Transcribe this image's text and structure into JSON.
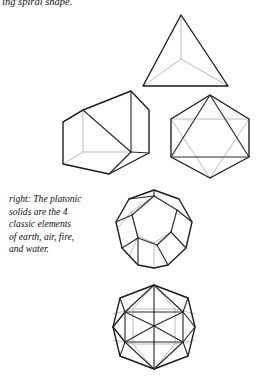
{
  "page": {
    "background_color": "#ffffff",
    "width": 258,
    "height": 376
  },
  "colors": {
    "text": "#111111",
    "visible_edge": "#1b1b1b",
    "inner_edge": "#2a2a2a",
    "hidden_edge": "#bdbdbd"
  },
  "top_caption": {
    "text": "ing spiral shape."
  },
  "side_caption": {
    "lines": [
      "right: The platonic",
      "solids are the 4",
      "classic elements",
      "of earth, air, fire,",
      "and water."
    ],
    "full_text": "right: The platonic solids are the 4 classic elements of earth, air, fire, and water."
  },
  "figures": [
    {
      "name": "tetrahedron",
      "label": "tetrahedron",
      "faces": 4,
      "element": "fire"
    },
    {
      "name": "cube",
      "label": "cube",
      "faces": 6,
      "element": "earth"
    },
    {
      "name": "octahedron",
      "label": "octahedron",
      "faces": 8,
      "element": "air"
    },
    {
      "name": "dodecahedron",
      "label": "dodecahedron",
      "faces": 12,
      "element": "aether"
    },
    {
      "name": "icosahedron",
      "label": "icosahedron",
      "faces": 20,
      "element": "water"
    }
  ]
}
